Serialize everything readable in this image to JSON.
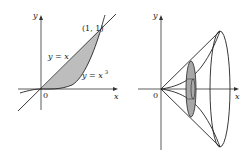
{
  "left_figure": {
    "axis_x_label": "x",
    "axis_y_label": "y",
    "origin_label": "0",
    "point_label": "(1, 1)",
    "curve_line_label": "y = x",
    "curve_cubic_label": "y = x",
    "curve_cubic_exponent": "3",
    "shade_color": "#b8b8b8"
  },
  "right_figure": {
    "axis_x_label": "x",
    "axis_y_label": "y",
    "origin_label": "0",
    "disk_color": "#a8a8a8"
  }
}
